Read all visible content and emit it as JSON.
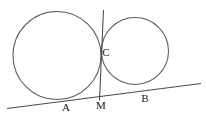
{
  "figure": {
    "background_color": "#ffffff",
    "stroke_color": "#5a5a5a",
    "label_color": "#1a1a1a",
    "width": 206,
    "height": 121
  },
  "labels": {
    "point_a": "A",
    "point_b": "B",
    "point_c": "C",
    "point_m": "M"
  },
  "geometry": {
    "large_circle": {
      "cx": 57,
      "cy": 55.5,
      "r": 44
    },
    "small_circle": {
      "cx": 135,
      "cy": 51,
      "r": 33.5
    },
    "tangent_line": {
      "x1": 7,
      "y1": 108.5,
      "x2": 201,
      "y2": 83.5
    },
    "vertical_line": {
      "x1": 103.5,
      "y1": 10,
      "x2": 99.5,
      "y2": 100.5
    },
    "label_positions": {
      "point_a": {
        "x": 66,
        "y": 111
      },
      "point_b": {
        "x": 145,
        "y": 102
      },
      "point_c": {
        "x": 106,
        "y": 56
      },
      "point_m": {
        "x": 101,
        "y": 109
      }
    }
  }
}
